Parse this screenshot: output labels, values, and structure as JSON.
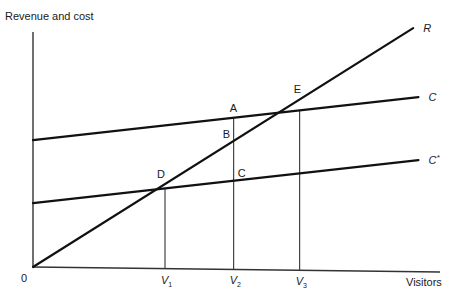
{
  "chart_data": {
    "type": "line",
    "title": "",
    "ylabel": "Revenue and cost",
    "xlabel": "Visitors",
    "origin_label": "0",
    "x_ticks": [
      {
        "name": "V1",
        "base": "V",
        "sub": "1",
        "x": 1
      },
      {
        "name": "V2",
        "base": "V",
        "sub": "2",
        "x": 1.52
      },
      {
        "name": "V3",
        "base": "V",
        "sub": "3",
        "x": 2.02
      }
    ],
    "xlim": [
      0,
      3.0
    ],
    "ylim": [
      0,
      1.0
    ],
    "series": [
      {
        "name": "R",
        "label": "R",
        "description": "Revenue",
        "intercept": 0,
        "slope": 0.353
      },
      {
        "name": "C",
        "label": "C",
        "description": "Cost",
        "intercept": 0.54,
        "slope": 0.0626
      },
      {
        "name": "C*",
        "label": "C",
        "label_sup": "*",
        "description": "Reduced cost",
        "intercept": 0.272,
        "slope": 0.0626
      }
    ],
    "points": [
      {
        "label": "D",
        "x": 1,
        "on": [
          "R",
          "C*"
        ]
      },
      {
        "label": "A",
        "x": 1.52,
        "on": [
          "C"
        ]
      },
      {
        "label": "B",
        "x": 1.52,
        "on": [
          "R"
        ]
      },
      {
        "label": "C",
        "x": 1.52,
        "on": [
          "C*"
        ]
      },
      {
        "label": "E",
        "x": 2.02,
        "on": [
          "R",
          "C"
        ]
      }
    ],
    "verticals": [
      1,
      1.52,
      2.02
    ],
    "grid": false,
    "legend": "none"
  }
}
